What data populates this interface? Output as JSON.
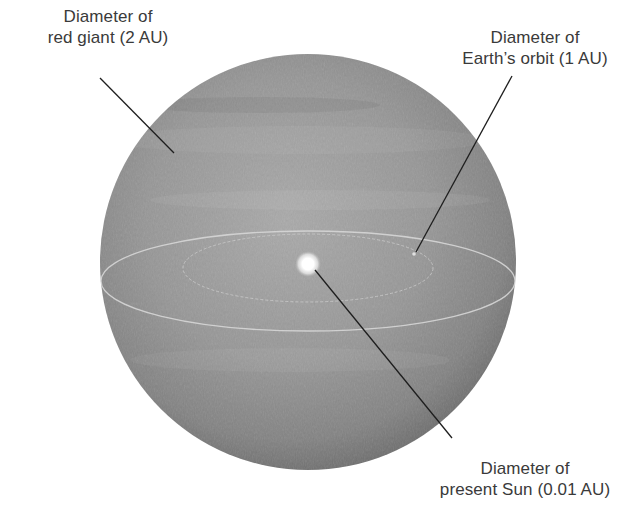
{
  "diagram": {
    "colors": {
      "background": "#ffffff",
      "sphere_light": "#a8a8a8",
      "sphere_mid": "#8e8e8e",
      "sphere_dark": "#6a6a6a",
      "orbit_line": "#d8d8d8",
      "sun_glow": "#ffffff",
      "leader_line": "#1e1e1e",
      "label_text": "#3a3a3a"
    },
    "labels": {
      "red_giant": {
        "line1": "Diameter of",
        "line2": "red giant (2 AU)"
      },
      "earth_orbit": {
        "line1": "Diameter of",
        "line2": "Earth’s orbit (1 AU)"
      },
      "present_sun": {
        "line1": "Diameter of",
        "line2": "present Sun (0.01 AU)"
      }
    },
    "objects": [
      {
        "name": "red giant",
        "diameter_au": 2
      },
      {
        "name": "Earth's orbit",
        "diameter_au": 1
      },
      {
        "name": "present Sun",
        "diameter_au": 0.01
      }
    ]
  }
}
